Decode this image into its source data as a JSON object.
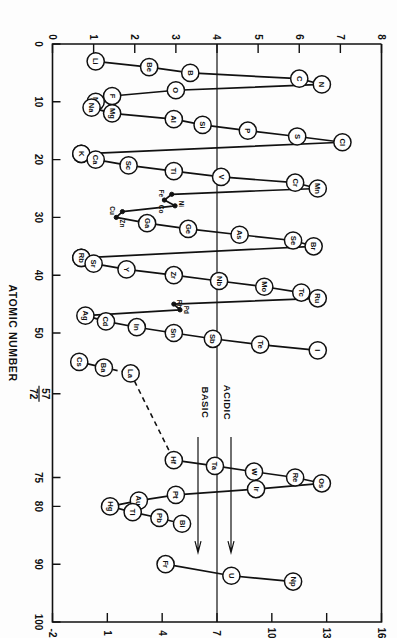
{
  "figure": {
    "orientation_degrees": 90,
    "background_color": "#fdfdfd",
    "ink_color": "#111111"
  },
  "chart_data": {
    "type": "line",
    "title": "",
    "xlabel": "ATOMIC NUMBER",
    "ylabel": "",
    "xlim": [
      0,
      100
    ],
    "ylim": [
      0,
      8
    ],
    "grid": false,
    "legend": "none",
    "x_ticks": [
      0,
      10,
      20,
      30,
      40,
      50,
      57,
      72,
      75,
      80,
      90,
      100
    ],
    "x_tick_labels": [
      "0",
      "10",
      "20",
      "30",
      "40",
      "50",
      "57",
      "72",
      "75",
      "80",
      "90",
      "100"
    ],
    "x_special_tick": {
      "position": 60.5,
      "numerator": "57",
      "denominator": "72"
    },
    "y_left_ticks": [
      0,
      1,
      2,
      3,
      4,
      5,
      6,
      7,
      8
    ],
    "y_left_tick_labels": [
      "0",
      "1",
      "2",
      "3",
      "4",
      "5",
      "6",
      "7",
      "8"
    ],
    "y_right_ticks": [
      -2,
      1,
      4,
      7,
      10,
      13,
      16
    ],
    "y_right_tick_labels": [
      "-2",
      "1",
      "4",
      "7",
      "10",
      "13",
      "16"
    ],
    "y_right_scale_note": "pH",
    "neutral_line_value": 7,
    "region_labels": [
      {
        "text": "ACIDIC",
        "side": "above-neutral"
      },
      {
        "text": "BASIC",
        "side": "below-neutral"
      }
    ],
    "series": [
      {
        "name": "period-2",
        "style": "solid",
        "points": [
          {
            "label": "Li",
            "x": 3,
            "y": 1.05
          },
          {
            "label": "Be",
            "x": 4,
            "y": 2.35
          },
          {
            "label": "B",
            "x": 5,
            "y": 3.35
          },
          {
            "label": "C",
            "x": 6,
            "y": 6.0
          },
          {
            "label": "N",
            "x": 7,
            "y": 6.55
          },
          {
            "label": "O",
            "x": 8,
            "y": 3.0
          },
          {
            "label": "F",
            "x": 9,
            "y": 1.45
          },
          {
            "label": "Ne",
            "x": 10,
            "y": 1.05
          }
        ]
      },
      {
        "name": "period-3",
        "style": "solid",
        "points": [
          {
            "label": "Na",
            "x": 11,
            "y": 0.95
          },
          {
            "label": "Mg",
            "x": 12,
            "y": 1.45
          },
          {
            "label": "Al",
            "x": 13,
            "y": 2.95
          },
          {
            "label": "Si",
            "x": 14,
            "y": 3.65
          },
          {
            "label": "P",
            "x": 15,
            "y": 4.75
          },
          {
            "label": "S",
            "x": 16,
            "y": 5.95
          },
          {
            "label": "Cl",
            "x": 17,
            "y": 7.05
          },
          {
            "label": "K",
            "x": 19,
            "y": 0.7
          }
        ]
      },
      {
        "name": "period-4a",
        "style": "solid",
        "points": [
          {
            "label": "K",
            "x": 19,
            "y": 0.7
          },
          {
            "label": "Ca",
            "x": 20,
            "y": 1.05
          },
          {
            "label": "Sc",
            "x": 21,
            "y": 1.85
          },
          {
            "label": "Ti",
            "x": 22,
            "y": 2.95
          },
          {
            "label": "V",
            "x": 23,
            "y": 4.1
          },
          {
            "label": "Cr",
            "x": 24,
            "y": 5.9
          },
          {
            "label": "Mn",
            "x": 25,
            "y": 6.45
          }
        ]
      },
      {
        "name": "period-4b-transition",
        "style": "solid",
        "marker": "dot",
        "points": [
          {
            "label": "Mn",
            "x": 25,
            "y": 6.45,
            "hidden_label": true
          },
          {
            "label": "Fe",
            "x": 26,
            "y": 2.9
          },
          {
            "label": "Co",
            "x": 27,
            "y": 2.72
          },
          {
            "label": "Ni",
            "x": 28,
            "y": 2.98
          },
          {
            "label": "Cu",
            "x": 29,
            "y": 1.7
          },
          {
            "label": "Zn",
            "x": 30,
            "y": 1.55
          }
        ]
      },
      {
        "name": "period-4c",
        "style": "solid",
        "points": [
          {
            "label": "Zn",
            "x": 30,
            "y": 1.55,
            "hidden_label": true
          },
          {
            "label": "Ga",
            "x": 31,
            "y": 2.3
          },
          {
            "label": "Ge",
            "x": 32,
            "y": 3.3
          },
          {
            "label": "As",
            "x": 33,
            "y": 4.55
          },
          {
            "label": "Se",
            "x": 34,
            "y": 5.85
          },
          {
            "label": "Br",
            "x": 35,
            "y": 6.35
          },
          {
            "label": "Rb",
            "x": 37,
            "y": 0.7
          }
        ]
      },
      {
        "name": "period-5a",
        "style": "solid",
        "points": [
          {
            "label": "Rb",
            "x": 37,
            "y": 0.7
          },
          {
            "label": "Sr",
            "x": 38,
            "y": 1.0
          },
          {
            "label": "Y",
            "x": 39,
            "y": 1.8
          },
          {
            "label": "Zr",
            "x": 40,
            "y": 2.95
          },
          {
            "label": "Nb",
            "x": 41,
            "y": 4.05
          },
          {
            "label": "Mo",
            "x": 42,
            "y": 5.15
          },
          {
            "label": "Tc",
            "x": 43,
            "y": 6.05
          },
          {
            "label": "Ru",
            "x": 44,
            "y": 6.45
          }
        ]
      },
      {
        "name": "period-5b-transition",
        "style": "solid",
        "marker": "dot",
        "points": [
          {
            "label": "Ru",
            "x": 44,
            "y": 6.45,
            "hidden_label": true
          },
          {
            "label": "Rh",
            "x": 45,
            "y": 2.95
          },
          {
            "label": "Pd",
            "x": 46,
            "y": 3.1
          },
          {
            "label": "Ag",
            "x": 47,
            "y": 0.8
          }
        ]
      },
      {
        "name": "period-5c",
        "style": "solid",
        "points": [
          {
            "label": "Ag",
            "x": 47,
            "y": 0.8
          },
          {
            "label": "Cd",
            "x": 48,
            "y": 1.3
          },
          {
            "label": "In",
            "x": 49,
            "y": 2.05
          },
          {
            "label": "Sn",
            "x": 50,
            "y": 2.95
          },
          {
            "label": "Sb",
            "x": 51,
            "y": 3.9
          },
          {
            "label": "Te",
            "x": 52,
            "y": 5.05
          },
          {
            "label": "I",
            "x": 53,
            "y": 6.45
          }
        ]
      },
      {
        "name": "period-6a",
        "style": "solid",
        "points": [
          {
            "label": "Cs",
            "x": 55,
            "y": 0.65
          },
          {
            "label": "Ba",
            "x": 56,
            "y": 1.25
          }
        ]
      },
      {
        "name": "period-6-la-hf",
        "style": "dashed",
        "points": [
          {
            "label": "Ba",
            "x": 56,
            "y": 1.25,
            "hidden_label": true
          },
          {
            "label": "La",
            "x": 57,
            "y": 1.9
          },
          {
            "label": "Hf",
            "x": 72,
            "y": 2.95
          }
        ]
      },
      {
        "name": "period-6b",
        "style": "solid",
        "points": [
          {
            "label": "Hf",
            "x": 72,
            "y": 2.95,
            "hidden_label": true
          },
          {
            "label": "Ta",
            "x": 73,
            "y": 3.95
          },
          {
            "label": "W",
            "x": 74,
            "y": 4.9
          },
          {
            "label": "Re",
            "x": 75,
            "y": 5.9
          },
          {
            "label": "Os",
            "x": 76,
            "y": 6.55
          }
        ]
      },
      {
        "name": "period-6c",
        "style": "solid",
        "points": [
          {
            "label": "Os",
            "x": 76,
            "y": 6.55,
            "hidden_label": true
          },
          {
            "label": "Ir",
            "x": 77,
            "y": 4.95
          },
          {
            "label": "Pt",
            "x": 78,
            "y": 3.0
          },
          {
            "label": "Au",
            "x": 79,
            "y": 2.1
          },
          {
            "label": "Hg",
            "x": 80,
            "y": 1.4
          }
        ]
      },
      {
        "name": "period-6d",
        "style": "solid",
        "points": [
          {
            "label": "Hg",
            "x": 80,
            "y": 1.4,
            "hidden_label": true
          },
          {
            "label": "Tl",
            "x": 81,
            "y": 1.95
          },
          {
            "label": "Pb",
            "x": 82,
            "y": 2.6
          },
          {
            "label": "Bi",
            "x": 83,
            "y": 3.15
          }
        ]
      },
      {
        "name": "actinides",
        "style": "solid",
        "points": [
          {
            "label": "Fr",
            "x": 90,
            "y": 2.75
          },
          {
            "label": "U",
            "x": 92,
            "y": 4.35
          },
          {
            "label": "Np",
            "x": 93,
            "y": 5.85
          }
        ]
      }
    ]
  }
}
